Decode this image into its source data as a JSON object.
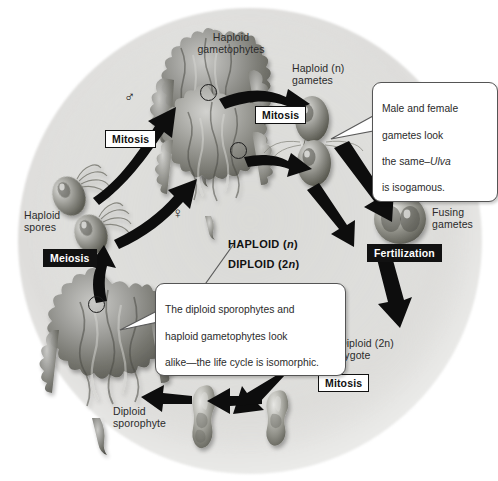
{
  "figure": {
    "background_color": "#e3e3e1",
    "ink_color": "#1b1b1b"
  },
  "labels": {
    "haploid_gametophytes": "Haploid\ngametophytes",
    "haploid_gametes": "Haploid (n)\ngametes",
    "fusing_gametes": "Fusing\ngametes",
    "diploid_zygote": "Diploid (2n)\nzygote",
    "diploid_sporophyte": "Diploid\nsporophyte",
    "haploid_spores": "Haploid\nspores"
  },
  "processes": {
    "mitosis_left": "Mitosis",
    "mitosis_top": "Mitosis",
    "mitosis_bottom": "Mitosis",
    "meiosis": "Meiosis",
    "fertilization": "Fertilization"
  },
  "ploidy": {
    "haploid": "HAPLOID (",
    "haploid_n": "n",
    "haploid_close": ")",
    "diploid": "DIPLOID (2",
    "diploid_n": "n",
    "diploid_close": ")"
  },
  "callouts": {
    "isogamous": {
      "line1": "Male and female",
      "line2": "gametes look",
      "line3_pre": "the same–",
      "line3_italic": "Ulva",
      "line4": "is isogamous."
    },
    "isomorphic": {
      "line1": "The diploid sporophytes and",
      "line2": "haploid gametophytes look",
      "line3": "alike—the life cycle is isomorphic."
    }
  },
  "symbols": {
    "male": "♂",
    "female": "♀"
  }
}
